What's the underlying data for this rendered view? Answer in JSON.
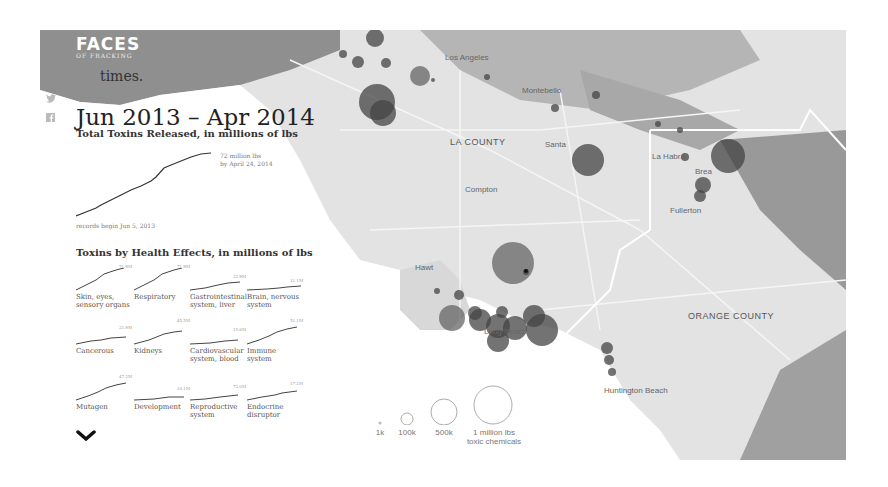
{
  "brand": {
    "logo_title": "FACES",
    "logo_subtitle": "OF FRACKING"
  },
  "intro": {
    "teaser_text": "times."
  },
  "social": {
    "twitter_icon": "twitter-icon",
    "facebook_icon": "facebook-icon"
  },
  "summary": {
    "date_range": "Jun 2013 – Apr 2014",
    "total_title": "Total Toxins Released, in millions of lbs",
    "end_annotation_line1": "72 million lbs",
    "end_annotation_line2": "by April 24, 2014",
    "start_annotation": "records begin Jun 5, 2013"
  },
  "health": {
    "title": "Toxins by Health Effects, in millions of lbs",
    "items": [
      {
        "label_line1": "Skin, eyes,",
        "label_line2": "sensory organs",
        "value": "71.9M"
      },
      {
        "label_line1": "Respiratory",
        "label_line2": "",
        "value": "71.9M"
      },
      {
        "label_line1": "Gastrointestinal",
        "label_line2": "system, liver",
        "value": "22.9M"
      },
      {
        "label_line1": "Brain, nervous",
        "label_line2": "system",
        "value": "11.1M"
      },
      {
        "label_line1": "Cancerous",
        "label_line2": "",
        "value": "21.9M"
      },
      {
        "label_line1": "Kidneys",
        "label_line2": "",
        "value": "45.5M"
      },
      {
        "label_line1": "Cardiovascular",
        "label_line2": "system, blood",
        "value": "15.6M"
      },
      {
        "label_line1": "Immune system",
        "label_line2": "",
        "value": "51.1M"
      },
      {
        "label_line1": "Mutagen",
        "label_line2": "",
        "value": "47.2M"
      },
      {
        "label_line1": "Development",
        "label_line2": "",
        "value": "10.1M"
      },
      {
        "label_line1": "Reproductive",
        "label_line2": "system",
        "value": "72.0M"
      },
      {
        "label_line1": "Endocrine",
        "label_line2": "disruptor",
        "value": "17.2M"
      }
    ]
  },
  "map": {
    "cities": [
      "Los Angeles",
      "Montebello",
      "Santa Fe Springs",
      "La Habra",
      "Brea",
      "Fullerton",
      "Compton",
      "Hawthorne",
      "Long Beach",
      "Huntington Beach"
    ],
    "counties": [
      "LA COUNTY",
      "ORANGE COUNTY"
    ]
  },
  "legend": {
    "items": [
      {
        "label": "1k"
      },
      {
        "label": "100k"
      },
      {
        "label": "500k"
      },
      {
        "label": "1 million lbs",
        "label_line2": "toxic chemicals"
      }
    ]
  }
}
